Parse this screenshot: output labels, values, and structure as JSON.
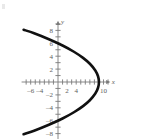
{
  "chart_data": {
    "type": "line",
    "title": "",
    "subtitle": "",
    "xlabel": "x",
    "ylabel": "y",
    "xlim": [
      -8,
      11.5
    ],
    "ylim": [
      -9,
      9.5
    ],
    "grid": false,
    "legend": null,
    "annotations": [],
    "equation": "x = 9 - y^2/4",
    "vertex": {
      "x": 9,
      "y": 0
    },
    "opens": "left",
    "x_ticks": [
      -7,
      -6,
      -5,
      -4,
      -3,
      -2,
      -1,
      1,
      2,
      3,
      4,
      5,
      6,
      7,
      8,
      9,
      10,
      11
    ],
    "y_ticks": [
      -8,
      -7,
      -6,
      -5,
      -4,
      -3,
      -2,
      -1,
      1,
      2,
      3,
      4,
      5,
      6,
      7,
      8,
      9
    ],
    "x_tick_labels": [
      {
        "value": -6,
        "text": "–6"
      },
      {
        "value": -4,
        "text": "–4"
      },
      {
        "value": 2,
        "text": "2"
      },
      {
        "value": 4,
        "text": "4"
      },
      {
        "value": 10,
        "text": "10"
      }
    ],
    "y_tick_labels": [
      {
        "value": 8,
        "text": "8"
      },
      {
        "value": 6,
        "text": "6"
      },
      {
        "value": 4,
        "text": "4"
      },
      {
        "value": 2,
        "text": "2"
      },
      {
        "value": -2,
        "text": "–2"
      },
      {
        "value": -4,
        "text": "–4"
      },
      {
        "value": -6,
        "text": "–6"
      },
      {
        "value": -8,
        "text": "–8"
      }
    ],
    "series": [
      {
        "name": "parabola",
        "color": "#111111",
        "points": [
          {
            "x": -7.56,
            "y": 8.1
          },
          {
            "x": -5.25,
            "y": 7.55
          },
          {
            "x": -2.0,
            "y": 6.63
          },
          {
            "x": 1.0,
            "y": 5.66
          },
          {
            "x": 3.5,
            "y": 4.69
          },
          {
            "x": 5.5,
            "y": 3.74
          },
          {
            "x": 7.0,
            "y": 2.83
          },
          {
            "x": 8.2,
            "y": 1.79
          },
          {
            "x": 8.8,
            "y": 0.89
          },
          {
            "x": 9.0,
            "y": 0.0
          },
          {
            "x": 8.8,
            "y": -0.89
          },
          {
            "x": 8.2,
            "y": -1.79
          },
          {
            "x": 7.0,
            "y": -2.83
          },
          {
            "x": 5.5,
            "y": -3.74
          },
          {
            "x": 3.5,
            "y": -4.69
          },
          {
            "x": 1.0,
            "y": -5.66
          },
          {
            "x": -2.0,
            "y": -6.63
          },
          {
            "x": -5.25,
            "y": -7.55
          },
          {
            "x": -7.56,
            "y": -8.1
          }
        ]
      }
    ],
    "axis_labels": {
      "x_axis_name": "x",
      "y_axis_name": "y"
    }
  },
  "colors": {
    "curve": "#111111",
    "axis": "#7a7a7a",
    "tick_text": "#5e5e5e",
    "background": "#ffffff"
  }
}
